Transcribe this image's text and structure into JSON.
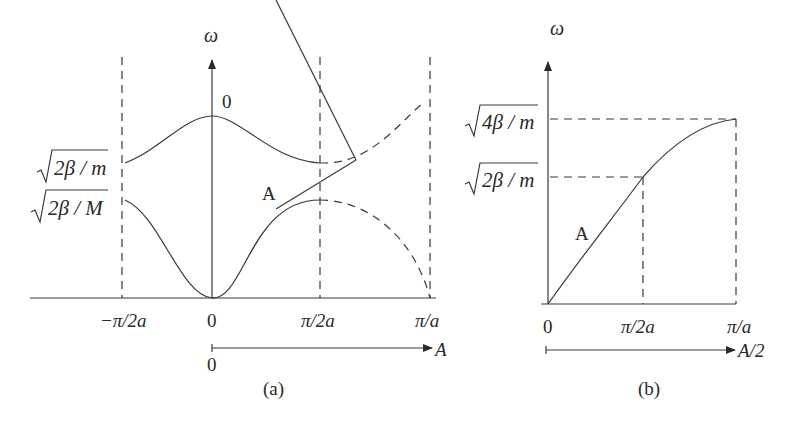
{
  "panel_a": {
    "caption": "(a)",
    "y_axis_label": "ω",
    "x_ticks": [
      "−π/2a",
      "0",
      "π/2a",
      "π/a"
    ],
    "y_labels": [
      "2β / m",
      "2β / M"
    ],
    "branch_labels": {
      "optical": "0",
      "acoustic": "A"
    },
    "lower_axis": {
      "origin": "0",
      "label": "A"
    }
  },
  "panel_b": {
    "caption": "(b)",
    "y_axis_label": "ω",
    "x_ticks": [
      "0",
      "π/2a",
      "π/a"
    ],
    "y_labels": [
      "4β / m",
      "2β / m"
    ],
    "branch_label": "A",
    "lower_axis": {
      "label": "A/2"
    }
  }
}
